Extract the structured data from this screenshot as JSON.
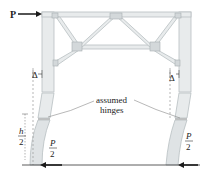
{
  "diagram": {
    "load_label": "P",
    "delta_left": "Δ",
    "delta_right": "Δ",
    "annotation_line1": "assumed",
    "annotation_line2": "hinges",
    "half_height_num": "h",
    "half_height_den": "2",
    "reaction_left_num": "P",
    "reaction_left_den": "2",
    "reaction_right_num": "P",
    "reaction_right_den": "2"
  },
  "colors": {
    "member_fill": "#e8ebec",
    "member_stroke": "#b8bfc2",
    "text": "#222222",
    "arrow": "#1a1a1a",
    "dashed": "#9a9a9a"
  }
}
